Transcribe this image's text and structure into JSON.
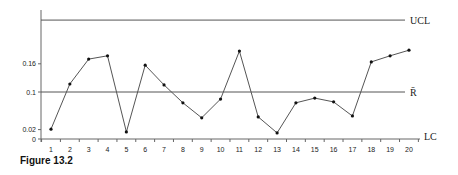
{
  "caption": "Figure 13.2",
  "chart_data": {
    "type": "line",
    "title": "",
    "xlabel": "",
    "ylabel": "",
    "categories": [
      "1",
      "2",
      "3",
      "4",
      "5",
      "6",
      "7",
      "8",
      "9",
      "10",
      "11",
      "12",
      "13",
      "14",
      "15",
      "16",
      "17",
      "18",
      "19",
      "20"
    ],
    "series": [
      {
        "name": "R",
        "values": [
          0.021,
          0.117,
          0.17,
          0.177,
          0.015,
          0.157,
          0.115,
          0.077,
          0.045,
          0.085,
          0.187,
          0.047,
          0.013,
          0.077,
          0.087,
          0.079,
          0.049,
          0.164,
          0.177,
          0.189
        ]
      }
    ],
    "yticks": [
      0,
      0.02,
      0.1,
      0.16
    ],
    "ytick_labels": [
      "0",
      "0.02",
      "0.1",
      "0.16"
    ],
    "ylim": [
      0,
      0.27
    ],
    "grid": false,
    "reference_lines": [
      {
        "name": "UCL",
        "label": "UCL",
        "value": 0.253
      },
      {
        "name": "R-bar",
        "label": "R̄",
        "value": 0.1
      },
      {
        "name": "LC",
        "label": "LC",
        "value": 0
      }
    ],
    "colors": {
      "line": "#555555",
      "marker": "#111111",
      "axis": "#666666",
      "reference": "#555555"
    }
  }
}
